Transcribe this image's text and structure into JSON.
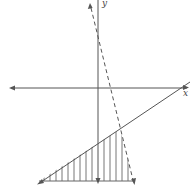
{
  "diagram": {
    "type": "inequality-graph",
    "axes": {
      "x_label": "x",
      "y_label": "y",
      "color": "#555555"
    },
    "lines": [
      {
        "name": "boundary-solid",
        "style": "solid",
        "from": [
          39,
          183
        ],
        "to": [
          190,
          82
        ]
      },
      {
        "name": "boundary-dashed",
        "style": "dashed",
        "from": [
          90,
          5
        ],
        "to": [
          134,
          183
        ]
      }
    ],
    "shaded_region": {
      "pattern": "vertical-hatch",
      "vertices": [
        [
          39,
          181
        ],
        [
          120,
          129
        ],
        [
          133,
          181
        ]
      ]
    },
    "colors": {
      "line": "#555555",
      "hatch": "#666666",
      "background": "#ffffff"
    }
  }
}
